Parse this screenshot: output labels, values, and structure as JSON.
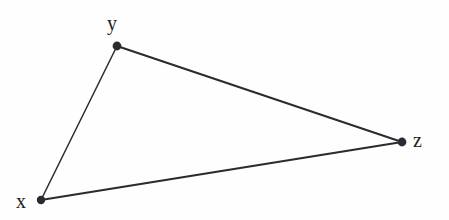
{
  "figure": {
    "type": "geometry-diagram",
    "shape": "triangle",
    "background_color": "#fefefe",
    "stroke_color": "#2a2a30",
    "label_color": "#1d1d22",
    "width": 449,
    "height": 220
  },
  "vertices": [
    {
      "id": "x",
      "label": "x",
      "cx": 41,
      "cy": 200,
      "r": 4.2,
      "label_x": 16,
      "label_y": 191
    },
    {
      "id": "y",
      "label": "y",
      "cx": 117,
      "cy": 46,
      "r": 4.4,
      "label_x": 107,
      "label_y": 13
    },
    {
      "id": "z",
      "label": "z",
      "cx": 402,
      "cy": 142,
      "r": 4.4,
      "label_x": 413,
      "label_y": 130
    }
  ],
  "edges": [
    {
      "id": "xy",
      "from": "x",
      "to": "y",
      "x1": 41,
      "y1": 200,
      "x2": 117,
      "y2": 46,
      "width": 1.5
    },
    {
      "id": "yz",
      "from": "y",
      "to": "z",
      "x1": 117,
      "y1": 46,
      "x2": 402,
      "y2": 142,
      "width": 2.1
    },
    {
      "id": "xz",
      "from": "x",
      "to": "z",
      "x1": 41,
      "y1": 200,
      "x2": 402,
      "y2": 142,
      "width": 2.1
    }
  ]
}
